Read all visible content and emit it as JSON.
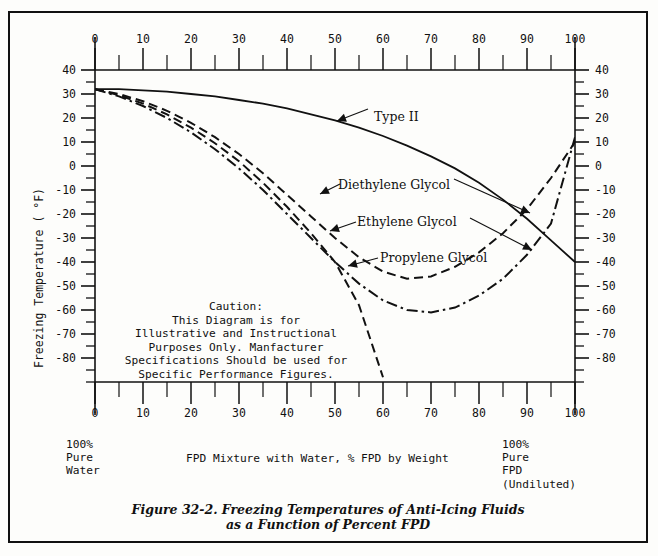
{
  "figure": {
    "caption_line1": "Figure 32-2. Freezing Temperatures of Anti-Icing Fluids",
    "caption_line2": "as a Function of Percent FPD"
  },
  "chart_data": {
    "type": "line",
    "xlabel": "FPD Mixture with Water, % FPD by Weight",
    "ylabel": "Freezing Temperature ( °F)",
    "xlim": [
      0,
      100
    ],
    "ylim": [
      -90,
      40
    ],
    "x_ticks": [
      0,
      10,
      20,
      30,
      40,
      50,
      60,
      70,
      80,
      90,
      100
    ],
    "x_minor_step": 5,
    "y_ticks": [
      40,
      30,
      20,
      10,
      0,
      -10,
      -20,
      -30,
      -40,
      -50,
      -60,
      -70,
      -80
    ],
    "y_minor_step": 5,
    "grid": false,
    "legend": "inline-annotations",
    "axes_mirrored": {
      "top_x_axis": true,
      "right_y_axis": true
    },
    "series": [
      {
        "name": "Type II",
        "style": "solid",
        "x": [
          0,
          5,
          10,
          15,
          20,
          25,
          30,
          35,
          40,
          45,
          50,
          55,
          60,
          65,
          70,
          75,
          80,
          85,
          90,
          95,
          100
        ],
        "y": [
          32,
          32,
          31.5,
          31,
          30,
          29,
          27.5,
          26,
          24,
          21.5,
          19,
          16,
          12.5,
          8.5,
          4,
          -1,
          -7,
          -14,
          -22,
          -31,
          -40
        ]
      },
      {
        "name": "Diethylene Glycol",
        "style": "dashed",
        "x": [
          0,
          5,
          10,
          15,
          20,
          25,
          30,
          35,
          40,
          45,
          50,
          55,
          60,
          65,
          70,
          75,
          80,
          85,
          90,
          95,
          100
        ],
        "y": [
          32,
          30,
          27,
          23,
          18,
          12,
          5,
          -3,
          -12,
          -21,
          -30,
          -38,
          -44,
          -47,
          -46,
          -42,
          -36,
          -28,
          -18,
          -5,
          10
        ]
      },
      {
        "name": "Ethylene Glycol",
        "style": "dashed",
        "x": [
          0,
          5,
          10,
          15,
          20,
          25,
          30,
          35,
          40,
          45,
          50,
          55,
          60
        ],
        "y": [
          32,
          29.5,
          26,
          21.5,
          16,
          9.5,
          2,
          -7,
          -17,
          -28,
          -40,
          -58,
          -88
        ]
      },
      {
        "name": "Propylene Glycol",
        "style": "dash-dot",
        "x": [
          0,
          5,
          10,
          15,
          20,
          25,
          30,
          35,
          40,
          45,
          50,
          55,
          60,
          65,
          70,
          75,
          80,
          85,
          90,
          95,
          100
        ],
        "y": [
          32,
          29,
          25,
          20,
          14,
          7,
          -1,
          -10,
          -20,
          -30,
          -40,
          -49,
          -56,
          -60,
          -61,
          -59,
          -54,
          -47,
          -37,
          -24,
          12
        ]
      }
    ],
    "annotations": [
      {
        "text": "Type II",
        "for": "Type II"
      },
      {
        "text": "Diethylene Glycol",
        "for": "Diethylene Glycol"
      },
      {
        "text": "Ethylene Glycol",
        "for": "Ethylene Glycol"
      },
      {
        "text": "Propylene Glycol",
        "for": "Propylene Glycol"
      }
    ],
    "caution_note": [
      "Caution:",
      "This Diagram is for",
      "Illustrative and Instructional",
      "Purposes Only. Manfacturer",
      "Specifications Should be used for",
      "Specific Performance Figures."
    ],
    "end_labels": {
      "left": [
        "100%",
        "Pure",
        "Water"
      ],
      "right": [
        "100%",
        "Pure",
        "FPD",
        "(Undiluted)"
      ]
    }
  }
}
